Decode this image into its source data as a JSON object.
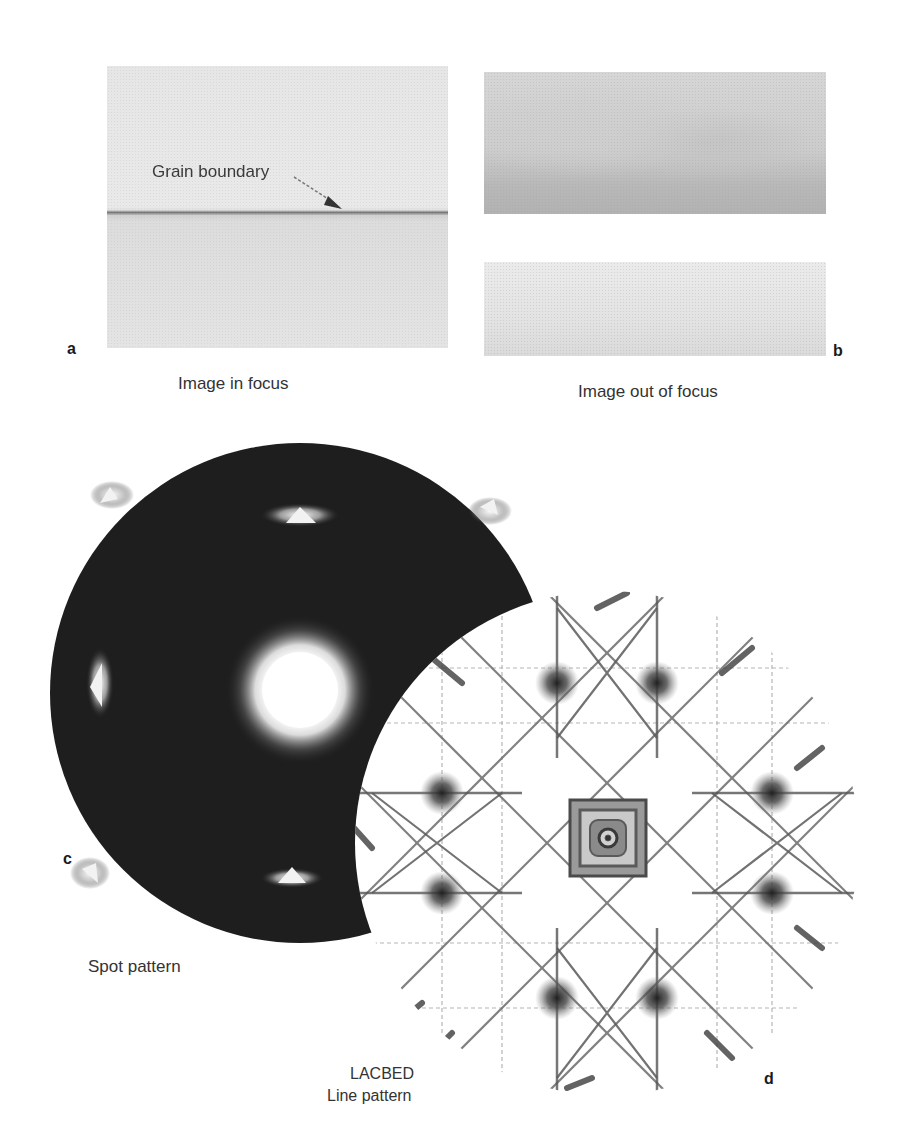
{
  "figure": {
    "panels": {
      "a": {
        "label": "a",
        "caption": "Image in focus",
        "annotation": "Grain boundary"
      },
      "b": {
        "label": "b",
        "caption": "Image out of focus"
      },
      "c": {
        "label": "c",
        "caption": "Spot pattern"
      },
      "d": {
        "label": "d",
        "caption_line1": "LACBED",
        "caption_line2": "Line pattern"
      }
    },
    "colors": {
      "spot_background": "#1c1c1c",
      "spot_bright": "#ffffff",
      "lacbed_background": "#ffffff",
      "lacbed_lines": "#3a3a3a"
    }
  }
}
